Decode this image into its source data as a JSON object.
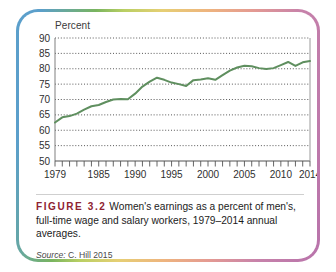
{
  "figure": {
    "label": "FIGURE 3.2",
    "caption": " Women's earnings as a percent of men's, full-time wage and salary workers, 1979–2014 annual averages.",
    "source_word": "Source:",
    "source_text": " C. Hill 2015",
    "border_colors": [
      "#5b9fcb",
      "#79b45f",
      "#b9cf63",
      "#e6cf74",
      "#eeb47e",
      "#e49a92",
      "#b873ab"
    ],
    "label_color": "#8e2230"
  },
  "chart_data": {
    "type": "line",
    "title": "",
    "subtitle": "",
    "xlabel": "",
    "ylabel": "Percent",
    "ylim": [
      50,
      90
    ],
    "xlim": [
      1979,
      2014
    ],
    "grid": true,
    "legend": "none",
    "line_color": "#5f8f5f",
    "ytick_labels": [
      "90",
      "85",
      "80",
      "75",
      "70",
      "65",
      "60",
      "55",
      "50"
    ],
    "yticks": [
      90,
      85,
      80,
      75,
      70,
      65,
      60,
      55,
      50
    ],
    "xtick_labels": [
      "1979",
      "1985",
      "1990",
      "1995",
      "2000",
      "2005",
      "2010",
      "2014"
    ],
    "xticks": [
      1979,
      1985,
      1990,
      1995,
      2000,
      2005,
      2010,
      2014
    ],
    "x": [
      1979,
      1980,
      1981,
      1982,
      1983,
      1984,
      1985,
      1986,
      1987,
      1988,
      1989,
      1990,
      1991,
      1992,
      1993,
      1994,
      1995,
      1996,
      1997,
      1998,
      1999,
      2000,
      2001,
      2002,
      2003,
      2004,
      2005,
      2006,
      2007,
      2008,
      2009,
      2010,
      2011,
      2012,
      2013,
      2014
    ],
    "values": [
      62.5,
      64.2,
      64.6,
      65.4,
      66.7,
      67.8,
      68.2,
      69.2,
      70.0,
      70.2,
      70.1,
      71.9,
      74.2,
      75.8,
      77.1,
      76.4,
      75.5,
      75.0,
      74.4,
      76.3,
      76.5,
      76.9,
      76.4,
      77.9,
      79.4,
      80.4,
      81.0,
      80.8,
      80.2,
      79.9,
      80.2,
      81.2,
      82.2,
      80.9,
      82.1,
      82.5
    ],
    "series_name": "Women's earnings as a percent of men's",
    "units": "percent"
  }
}
